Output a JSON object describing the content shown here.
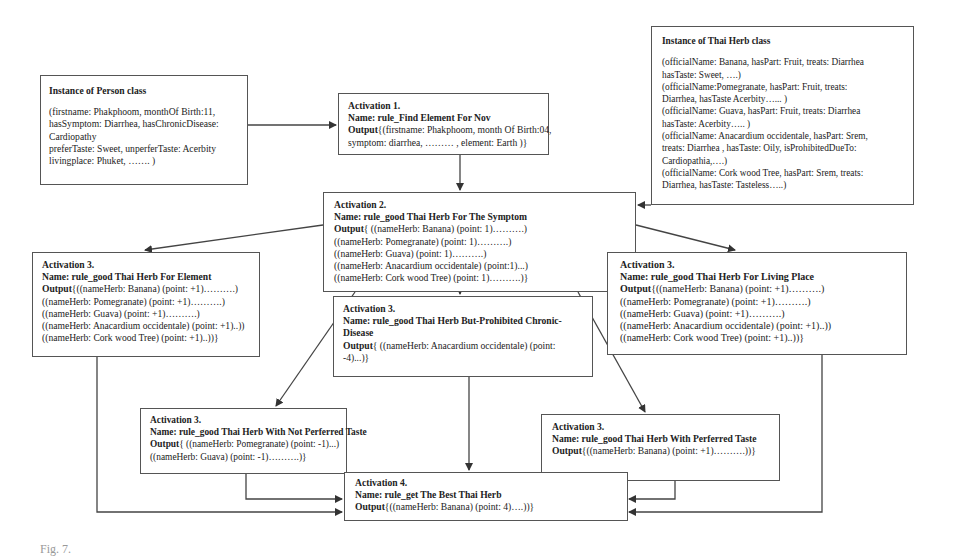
{
  "diagram": {
    "person_instance": {
      "title": "Instance of Person class",
      "lines": [
        "(firstname: Phakphoom, monthOf Birth:11,",
        "hasSymptom: Diarrhea, hasChronicDisease:",
        "Cardiopathy",
        "preferTaste: Sweet,  unperferTaste: Acerbity",
        "livingplace: Phuket, ……. )"
      ]
    },
    "herb_instance": {
      "title": "Instance of Thai Herb class",
      "lines": [
        "(officialName: Banana, hasPart: Fruit, treats: Diarrhea",
        "hasTaste: Sweet, ….)",
        "(officialName:Pomegranate, hasPart: Fruit, treats:",
        "Diarrhea, hasTaste Acerbity…... )",
        "(officialName: Guava, hasPart: Fruit, treats: Diarrhea",
        "hasTaste: Acerbity….. )",
        "(officialName: Anacardium occidentale, hasPart: Srem,",
        "treats: Diarrhea , hasTaste: Oily,  isProhibitedDueTo:",
        "Cardiopathia,….)",
        "(officialName: Cork wood Tree, hasPart: Srem, treats:",
        "Diarrhea, hasTaste: Tasteless…..)"
      ]
    },
    "activation1": {
      "title": "Activation 1.",
      "name": "Name: rule_Find Element For Nov",
      "output_label": "Output",
      "lines": [
        "{(firstname: Phakphoom, month Of Birth:04,",
        "symptom: diarrhea, ……… , element: Earth )}"
      ]
    },
    "activation2": {
      "title": "Activation 2.",
      "name": "Name: rule_good Thai Herb For The Symptom",
      "output_label": "Output",
      "lines": [
        "{ ((nameHerb: Banana) (point: 1)……….)",
        " ((nameHerb: Pomegranate) (point: 1)……….)",
        "((nameHerb: Guava) (point: 1)……….)",
        "((nameHerb: Anacardium occidentale) (point:1)...)",
        "((nameHerb: Cork wood Tree) (point: 1)……….)}"
      ]
    },
    "activation3_element": {
      "title": "Activation 3.",
      "name": "Name: rule_good Thai Herb For Element",
      "output_label": "Output",
      "lines": [
        "{((nameHerb: Banana) (point: +1)……….)",
        " ((nameHerb: Pomegranate) (point: +1)……….)",
        "((nameHerb: Guava) (point: +1)……….)",
        "((nameHerb: Anacardium occidentale) (point: +1)..))",
        "((nameHerb: Cork wood Tree) (point: +1)..))}"
      ]
    },
    "activation3_living_place": {
      "title": "Activation 3.",
      "name": "Name: rule_good Thai Herb For Living Place",
      "output_label": "Output",
      "lines": [
        "{((nameHerb: Banana) (point: +1)……….)",
        " ((nameHerb: Pomegranate) (point: +1)……….)",
        "((nameHerb: Guava) (point: +1)……….)",
        "((nameHerb: Anacardium occidentale) (point: +1)..))",
        "((nameHerb: Cork wood Tree) (point: +1)..))}"
      ]
    },
    "activation3_prohibited": {
      "title": "Activation 3.",
      "name_line1": "Name: rule_good Thai Herb But-Prohibited Chronic-",
      "name_line2": "Disease",
      "output_label": "Output",
      "lines": [
        "{ ((nameHerb: Anacardium occidentale) (point:",
        "-4)...)}"
      ]
    },
    "activation3_not_preferred": {
      "title": "Activation 3.",
      "name": "Name: rule_good Thai Herb With Not Perferred Taste",
      "output_label": "Output",
      "lines": [
        "{ ((nameHerb: Pomegranate) (point: -1)...)",
        "((nameHerb: Guava) (point: -1)……….)}"
      ]
    },
    "activation3_preferred": {
      "title": "Activation 3.",
      "name": "Name: rule_good Thai Herb With Perferred Taste",
      "output_label": "Output",
      "lines": [
        "{((nameHerb: Banana) (point: +1)……….))}"
      ]
    },
    "activation4": {
      "title": "Activation 4.",
      "name": "Name: rule_get The Best Thai Herb",
      "output_label": "Output",
      "lines": [
        "{((nameHerb: Banana) (point:  4)….))}"
      ]
    }
  },
  "caption": {
    "text": "Fig. 7."
  },
  "colors": {
    "line": "#444444",
    "border": "#555555",
    "text": "#222222"
  }
}
